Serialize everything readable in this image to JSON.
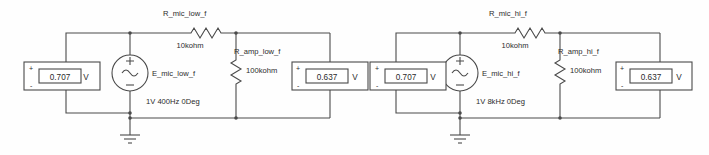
{
  "diagram": {
    "type": "schematic",
    "colors": {
      "wire": "#4a4a4a",
      "text": "#2b2b2b",
      "background": "#ffffff"
    },
    "units": {
      "volt_symbol": "V",
      "plus_sign": "+",
      "minus_sign": "-"
    }
  },
  "circuits": [
    {
      "id": "low-frequency",
      "source": {
        "name": "E_mic_low_f",
        "spec": "1V 400Hz 0Deg",
        "symbol": "ac-voltage-source"
      },
      "series_resistor": {
        "name": "R_mic_low_f",
        "value": "10kohm"
      },
      "load_resistor": {
        "name": "R_amp_low_f",
        "value": "100kohm"
      },
      "meters": [
        {
          "id": "source-meter-low",
          "value": "0.707",
          "unit": "V"
        },
        {
          "id": "load-meter-low",
          "value": "0.637",
          "unit": "V"
        }
      ],
      "ground": "earth-ground"
    },
    {
      "id": "high-frequency",
      "source": {
        "name": "E_mic_hi_f",
        "spec": "1V 8kHz 0Deg",
        "symbol": "ac-voltage-source"
      },
      "series_resistor": {
        "name": "R_mic_hi_f",
        "value": "10kohm"
      },
      "load_resistor": {
        "name": "R_amp_hi_f",
        "value": "100kohm"
      },
      "meters": [
        {
          "id": "source-meter-hi",
          "value": "0.707",
          "unit": "V"
        },
        {
          "id": "load-meter-hi",
          "value": "0.637",
          "unit": "V"
        }
      ],
      "ground": "earth-ground"
    }
  ]
}
